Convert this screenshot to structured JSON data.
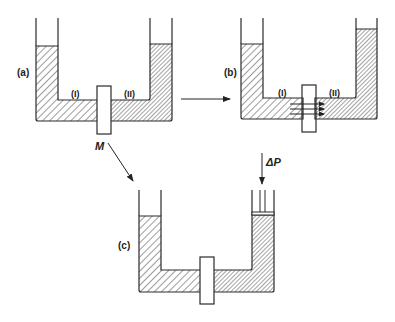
{
  "figure": {
    "panels": [
      {
        "id": "a",
        "label": "(a)",
        "compartment_left": "(I)",
        "compartment_right": "(II)",
        "membrane_label": "M"
      },
      {
        "id": "b",
        "label": "(b)",
        "compartment_left": "(I)",
        "compartment_right": "(II)"
      },
      {
        "id": "c",
        "label": "(c)",
        "pressure_label": "ΔP"
      }
    ],
    "colors": {
      "stroke": "#2a2a2a",
      "fill_solvent": "#ffffff",
      "hatch": "#3a3a3a"
    }
  }
}
